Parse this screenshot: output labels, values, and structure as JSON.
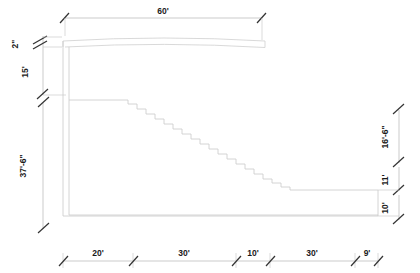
{
  "drawing": {
    "title": "Stepped Retaining Wall Elevation",
    "colors": {
      "geometry_stroke": "#c9c9c9",
      "dimension_line": "#b4b4b4",
      "tick": "#333333",
      "text": "#1a1a1a",
      "background": "#ffffff"
    },
    "dimensions": {
      "top": [
        {
          "name": "overall-width",
          "label": "60'",
          "value": 60,
          "unit": "ft"
        }
      ],
      "left": [
        {
          "name": "beam-thickness",
          "label": "2\"",
          "value": 2,
          "unit": "in"
        },
        {
          "name": "upper-wall-height",
          "label": "15'",
          "value": 15,
          "unit": "ft"
        },
        {
          "name": "lower-wall-height",
          "label": "37'-6\"",
          "value": 37.5,
          "unit": "ft"
        }
      ],
      "right": [
        {
          "name": "upper-step-drop",
          "label": "16'-6\"",
          "value": 16.5,
          "unit": "ft"
        },
        {
          "name": "mid-step-drop",
          "label": "11'",
          "value": 11,
          "unit": "ft"
        },
        {
          "name": "base-height",
          "label": "10'",
          "value": 10,
          "unit": "ft"
        }
      ],
      "bottom": [
        {
          "name": "segment-1",
          "label": "20'",
          "value": 20,
          "unit": "ft"
        },
        {
          "name": "segment-2",
          "label": "30'",
          "value": 30,
          "unit": "ft"
        },
        {
          "name": "segment-3",
          "label": "10'",
          "value": 10,
          "unit": "ft"
        },
        {
          "name": "segment-4",
          "label": "30'",
          "value": 30,
          "unit": "ft"
        },
        {
          "name": "segment-5",
          "label": "9'",
          "value": 9,
          "unit": "ft"
        }
      ]
    }
  }
}
